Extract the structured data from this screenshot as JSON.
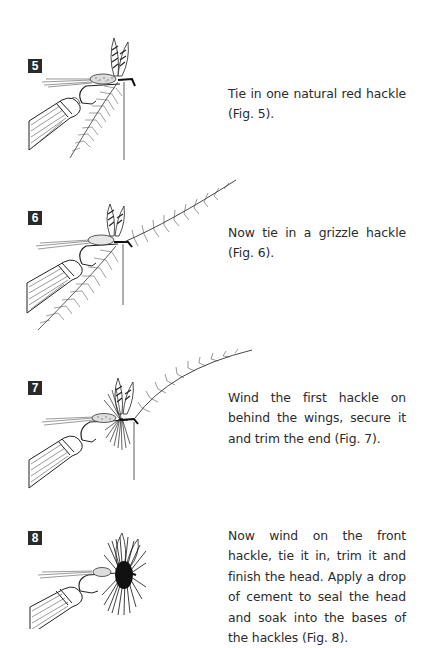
{
  "page": {
    "background": "#ffffff",
    "text_color": "#2b2b2b",
    "badge_color": "#2a2a2a"
  },
  "steps": [
    {
      "number": "5",
      "figure_label": "Fig. 5",
      "text": "Tie in one natural red hackle (Fig. 5)."
    },
    {
      "number": "6",
      "figure_label": "Fig. 6",
      "text": "Now tie in a grizzle hackle (Fig. 6)."
    },
    {
      "number": "7",
      "figure_label": "Fig. 7",
      "text": "Wind the first hackle on behind the wings, secure it and trim the end (Fig. 7)."
    },
    {
      "number": "8",
      "figure_label": "Fig. 8",
      "text": "Now wind on the front hackle, tie it in, trim it and finish the head. Apply a drop of cement to seal the head and soak into the bases of the hackles (Fig. 8)."
    }
  ]
}
